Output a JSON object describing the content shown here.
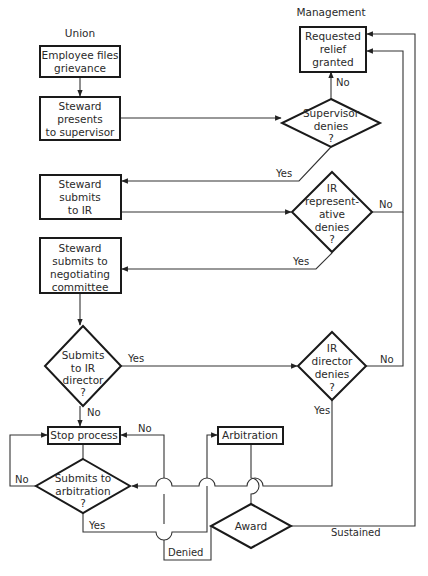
{
  "diagram": {
    "type": "flowchart",
    "lanes": {
      "union": "Union",
      "management": "Management"
    },
    "nodes": {
      "employee_files": {
        "shape": "box",
        "lines": [
          "Employee files",
          "grievance"
        ]
      },
      "steward_presents": {
        "shape": "box",
        "lines": [
          "Steward",
          "presents",
          "to supervisor"
        ]
      },
      "relief_granted": {
        "shape": "box",
        "lines": [
          "Requested",
          "relief",
          "granted"
        ]
      },
      "supervisor_denies": {
        "shape": "diamond",
        "lines": [
          "Supervisor",
          "denies",
          "?"
        ]
      },
      "steward_submits_ir": {
        "shape": "box",
        "lines": [
          "Steward",
          "submits",
          "to IR"
        ]
      },
      "ir_rep_denies": {
        "shape": "diamond",
        "lines": [
          "IR",
          "represent-",
          "ative",
          "denies",
          "?"
        ]
      },
      "steward_submits_committee": {
        "shape": "box",
        "lines": [
          "Steward",
          "submits to",
          "negotiating",
          "committee"
        ]
      },
      "submits_ir_director": {
        "shape": "diamond",
        "lines": [
          "Submits",
          "to IR",
          "director",
          "?"
        ]
      },
      "ir_director_denies": {
        "shape": "diamond",
        "lines": [
          "IR",
          "director",
          "denies",
          "?"
        ]
      },
      "stop_process": {
        "shape": "box",
        "lines": [
          "Stop process"
        ]
      },
      "submits_arbitration": {
        "shape": "diamond",
        "lines": [
          "Submits to",
          "arbitration",
          "?"
        ]
      },
      "arbitration": {
        "shape": "box",
        "lines": [
          "Arbitration"
        ]
      },
      "award": {
        "shape": "diamond",
        "lines": [
          "Award"
        ]
      }
    },
    "edge_labels": {
      "supervisor_no": "No",
      "supervisor_yes": "Yes",
      "ir_rep_no": "No",
      "ir_rep_yes": "Yes",
      "ir_director_submit_yes": "Yes",
      "ir_director_submit_no": "No",
      "ir_director_no": "No",
      "ir_director_yes": "Yes",
      "arbitration_no_left": "No",
      "arbitration_yes": "Yes",
      "award_denied_no": "No",
      "award_denied": "Denied",
      "award_sustained": "Sustained"
    },
    "edges": [
      {
        "from": "employee_files",
        "to": "steward_presents"
      },
      {
        "from": "steward_presents",
        "to": "supervisor_denies"
      },
      {
        "from": "supervisor_denies",
        "to": "relief_granted",
        "label": "No"
      },
      {
        "from": "supervisor_denies",
        "to": "steward_submits_ir",
        "label": "Yes"
      },
      {
        "from": "steward_submits_ir",
        "to": "ir_rep_denies"
      },
      {
        "from": "ir_rep_denies",
        "to": "relief_granted",
        "label": "No"
      },
      {
        "from": "ir_rep_denies",
        "to": "steward_submits_committee",
        "label": "Yes"
      },
      {
        "from": "steward_submits_committee",
        "to": "submits_ir_director"
      },
      {
        "from": "submits_ir_director",
        "to": "ir_director_denies",
        "label": "Yes"
      },
      {
        "from": "submits_ir_director",
        "to": "stop_process",
        "label": "No"
      },
      {
        "from": "ir_director_denies",
        "to": "relief_granted",
        "label": "No"
      },
      {
        "from": "ir_director_denies",
        "to": "submits_arbitration",
        "label": "Yes"
      },
      {
        "from": "submits_arbitration",
        "to": "stop_process",
        "label": "No"
      },
      {
        "from": "submits_arbitration",
        "to": "arbitration",
        "label": "Yes"
      },
      {
        "from": "arbitration",
        "to": "award"
      },
      {
        "from": "award",
        "to": "stop_process",
        "label": "Denied"
      },
      {
        "from": "award",
        "to": "relief_granted",
        "label": "Sustained"
      }
    ]
  }
}
